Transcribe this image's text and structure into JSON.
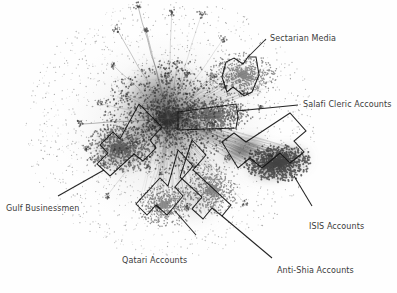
{
  "figure": {
    "type": "network-graph",
    "background_color": "#fefefe",
    "ink_color": "#111111",
    "text_color": "#3a3a3a",
    "width": 397,
    "height": 293
  },
  "chart_data": {
    "type": "scatter",
    "title": "",
    "xlabel": "",
    "ylabel": "",
    "grid": false,
    "legend": "none",
    "clusters": [
      {
        "name": "Sectarian Media",
        "cx": 243,
        "cy": 75,
        "rx": 34,
        "ry": 22,
        "density": 0.35,
        "darkness": 0.45
      },
      {
        "name": "Salafi Cleric Accounts",
        "cx": 215,
        "cy": 115,
        "rx": 38,
        "ry": 16,
        "density": 0.4,
        "darkness": 0.5
      },
      {
        "name": "Gulf Businessmen",
        "cx": 118,
        "cy": 148,
        "rx": 34,
        "ry": 24,
        "density": 0.45,
        "darkness": 0.55
      },
      {
        "name": "Qatari Accounts",
        "cx": 165,
        "cy": 205,
        "rx": 28,
        "ry": 22,
        "density": 0.3,
        "darkness": 0.35
      },
      {
        "name": "Anti-Shia Accounts",
        "cx": 212,
        "cy": 190,
        "rx": 26,
        "ry": 26,
        "density": 0.32,
        "darkness": 0.38
      },
      {
        "name": "ISIS Accounts",
        "cx": 278,
        "cy": 163,
        "rx": 34,
        "ry": 18,
        "density": 0.8,
        "darkness": 0.85
      }
    ],
    "core": {
      "cx": 168,
      "cy": 118,
      "rx": 62,
      "ry": 56,
      "note": "dense central hairball core"
    }
  },
  "annotations": [
    {
      "id": "sectarian-media",
      "label": "Sectarian Media",
      "label_x": 270,
      "label_y": 34,
      "bracket_path": "M 222 77 L 226 62 L 234 58 L 243 64 L 248 57 L 256 57 L 259 75 L 252 92 L 244 96 L 233 87 L 227 92 Z",
      "leader_path": "M 248 57 L 266 39"
    },
    {
      "id": "salafi-cleric-accounts",
      "label": "Salafi Cleric Accounts",
      "label_x": 303,
      "label_y": 100,
      "bracket_path": "M 178 112 L 236 104 L 238 117 L 236 128 L 178 130 Z",
      "leader_path": "M 237 111 L 298 105"
    },
    {
      "id": "gulf-businessmen",
      "label": "Gulf Businessmen",
      "label_x": 6,
      "label_y": 204,
      "bracket_path": "M 139 104 L 162 127 L 150 140 L 156 148 L 143 161 L 134 154 L 110 176 L 97 164 L 108 153 L 100 145 L 113 132 L 120 139 Z",
      "leader_path": "M 104 170 L 58 196"
    },
    {
      "id": "qatari-accounts",
      "label": "Qatari Accounts",
      "label_x": 122,
      "label_y": 256,
      "bracket_path": "M 178 150 L 193 166 L 175 187 L 183 196 L 167 215 L 156 205 L 147 215 L 136 204 L 160 178 L 168 186 Z",
      "leader_path": "M 175 211 L 196 235"
    },
    {
      "id": "anti-shia-accounts",
      "label": "Anti-Shia Accounts",
      "label_x": 277,
      "label_y": 266,
      "bracket_path": "M 192 140 L 206 155 L 193 170 L 231 205 L 222 216 L 212 208 L 203 219 L 192 209 L 202 197 L 180 177 Z",
      "leader_path": "M 222 216 L 272 258"
    },
    {
      "id": "isis-accounts",
      "label": "ISIS Accounts",
      "label_x": 309,
      "label_y": 222,
      "bracket_path": "M 222 142 L 234 133 L 246 142 L 290 113 L 306 131 L 294 141 L 304 152 L 290 163 L 280 153 L 262 168 L 250 158 L 238 168 Z",
      "leader_path": "M 294 176 L 312 206"
    }
  ]
}
